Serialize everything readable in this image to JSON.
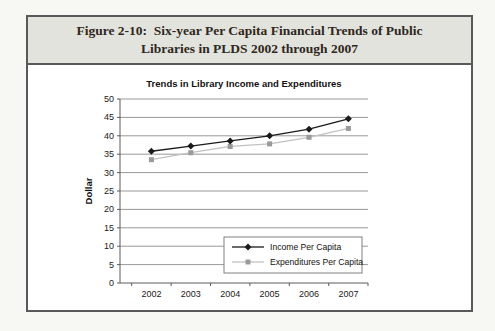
{
  "figure": {
    "title_lines": [
      "Figure 2-10:  Six-year Per Capita Financial Trends of Public",
      "Libraries in PLDS 2002 through 2007"
    ]
  },
  "chart_data": {
    "type": "line",
    "title": "Trends in Library Income and Expenditures",
    "xlabel": "",
    "ylabel": "Dollar",
    "categories": [
      "2002",
      "2003",
      "2004",
      "2005",
      "2006",
      "2007"
    ],
    "series": [
      {
        "name": "Income Per Capita",
        "values": [
          35.8,
          37.2,
          38.6,
          40.0,
          41.8,
          44.6
        ],
        "color": "#1a1a1a",
        "marker": "diamond",
        "marker_color": "#1a1a1a"
      },
      {
        "name": "Expenditures Per Capita",
        "values": [
          33.5,
          35.4,
          37.1,
          37.8,
          39.6,
          42.0
        ],
        "color": "#c2c2c2",
        "marker": "square",
        "marker_color": "#9a9a9a"
      }
    ],
    "ylim": [
      0,
      50
    ],
    "ytick_step": 5,
    "grid": true,
    "legend_position": "inside-bottom-right"
  },
  "theme": {
    "figure_band_bg": "#e3e3de",
    "figure_border": "#59595b",
    "figure_title_text": "#2f2721",
    "grid_color": "#999999",
    "axis_color": "#5a5a5a",
    "tick_text": "#1a1a1a",
    "legend_border": "#808080",
    "legend_bg": "#ffffff"
  }
}
